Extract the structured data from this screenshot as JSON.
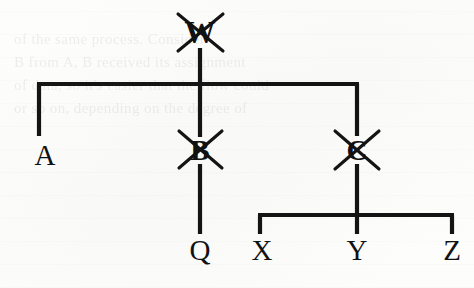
{
  "diagram": {
    "type": "tree",
    "ink_color": "#111111",
    "paper_color": "#fdfdfc",
    "strike_mark": "x-cross",
    "nodes": [
      {
        "id": "W",
        "label": "W",
        "x": 200,
        "y": 32,
        "struck": true,
        "size": 31
      },
      {
        "id": "A",
        "label": "A",
        "x": 45,
        "y": 155,
        "struck": false,
        "size": 29
      },
      {
        "id": "B",
        "label": "B",
        "x": 200,
        "y": 150,
        "struck": true,
        "size": 29
      },
      {
        "id": "C",
        "label": "C",
        "x": 357,
        "y": 150,
        "struck": true,
        "size": 29
      },
      {
        "id": "Q",
        "label": "Q",
        "x": 200,
        "y": 250,
        "struck": false,
        "size": 29
      },
      {
        "id": "X",
        "label": "X",
        "x": 262,
        "y": 250,
        "struck": false,
        "size": 29
      },
      {
        "id": "Y",
        "label": "Y",
        "x": 357,
        "y": 250,
        "struck": false,
        "size": 29
      },
      {
        "id": "Z",
        "label": "Z",
        "x": 452,
        "y": 250,
        "struck": false,
        "size": 29
      }
    ],
    "edges": [
      {
        "from": "W",
        "to": "A",
        "kind": "elbow"
      },
      {
        "from": "W",
        "to": "B",
        "kind": "straight"
      },
      {
        "from": "W",
        "to": "C",
        "kind": "elbow"
      },
      {
        "from": "B",
        "to": "Q",
        "kind": "straight"
      },
      {
        "from": "C",
        "to": "X",
        "kind": "elbow"
      },
      {
        "from": "C",
        "to": "Y",
        "kind": "straight"
      },
      {
        "from": "C",
        "to": "Z",
        "kind": "elbow"
      }
    ],
    "rails": [
      {
        "id": "upper-rail",
        "y": 84,
        "x1": 39,
        "x2": 357
      },
      {
        "id": "lower-rail",
        "y": 215,
        "x1": 260,
        "x2": 452
      }
    ],
    "background_text": "of the same process. Consider\nB from A, B received its assignment\nof data, so it's easier that the flow could\nor so on, depending on the degree of"
  }
}
